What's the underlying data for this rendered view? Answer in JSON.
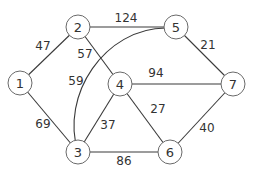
{
  "graph": {
    "type": "weighted-undirected-graph",
    "nodes": [
      {
        "id": "1",
        "label": "1",
        "x": 20,
        "y": 83
      },
      {
        "id": "2",
        "label": "2",
        "x": 78,
        "y": 27
      },
      {
        "id": "3",
        "label": "3",
        "x": 78,
        "y": 152
      },
      {
        "id": "4",
        "label": "4",
        "x": 120,
        "y": 84
      },
      {
        "id": "5",
        "label": "5",
        "x": 176,
        "y": 27
      },
      {
        "id": "6",
        "label": "6",
        "x": 170,
        "y": 152
      },
      {
        "id": "7",
        "label": "7",
        "x": 233,
        "y": 84
      }
    ],
    "edges": [
      {
        "from": "1",
        "to": "2",
        "weight": "47",
        "label_x": 43,
        "label_y": 46
      },
      {
        "from": "1",
        "to": "3",
        "weight": "69",
        "label_x": 43,
        "label_y": 124
      },
      {
        "from": "2",
        "to": "5",
        "weight": "124",
        "label_x": 126,
        "label_y": 18
      },
      {
        "from": "2",
        "to": "4",
        "weight": "57",
        "label_x": 85,
        "label_y": 54
      },
      {
        "from": "3",
        "to": "5",
        "weight": "59",
        "label_x": 76,
        "label_y": 81,
        "curved": true
      },
      {
        "from": "3",
        "to": "4",
        "weight": "37",
        "label_x": 108,
        "label_y": 125
      },
      {
        "from": "3",
        "to": "6",
        "weight": "86",
        "label_x": 124,
        "label_y": 161
      },
      {
        "from": "4",
        "to": "7",
        "weight": "94",
        "label_x": 156,
        "label_y": 73
      },
      {
        "from": "4",
        "to": "6",
        "weight": "27",
        "label_x": 158,
        "label_y": 109
      },
      {
        "from": "5",
        "to": "7",
        "weight": "21",
        "label_x": 208,
        "label_y": 45
      },
      {
        "from": "6",
        "to": "7",
        "weight": "40",
        "label_x": 207,
        "label_y": 128
      }
    ]
  },
  "colors": {
    "edge": "#3a3a3a",
    "node_border": "#6a6a6a",
    "text": "#333333",
    "background": "#ffffff"
  }
}
